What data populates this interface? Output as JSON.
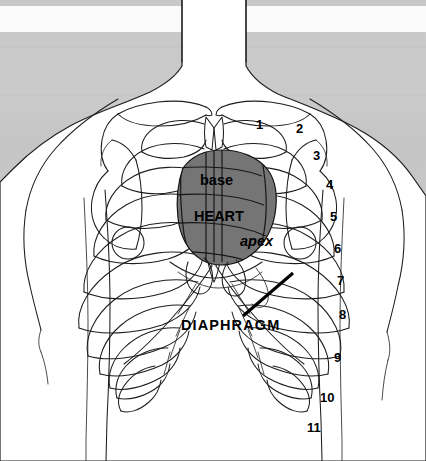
{
  "figure": {
    "width": 426,
    "height": 461,
    "colors": {
      "background_upper": "#c9c9c9",
      "background_lower": "#ffffff",
      "body_fill": "#ffffff",
      "outline": "#1d1d1d",
      "heart_fill": "#757575",
      "heart_outline": "#111111",
      "label_text": "#000000",
      "leader_line": "#000000"
    }
  },
  "organ_labels": [
    {
      "name": "base",
      "text": "base",
      "style": "bold",
      "x": 200,
      "y": 180
    },
    {
      "name": "heart",
      "text": "HEART",
      "style": "bold",
      "x": 194,
      "y": 216
    },
    {
      "name": "apex",
      "text": "apex",
      "style": "bold-italic",
      "x": 240,
      "y": 241
    }
  ],
  "structure_labels": [
    {
      "name": "diaphragm",
      "text": "DIAPHRAGM",
      "x": 181,
      "y": 325
    }
  ],
  "rib_numbers": [
    {
      "label": "1",
      "x": 256,
      "y": 124
    },
    {
      "label": "2",
      "x": 296,
      "y": 128
    },
    {
      "label": "3",
      "x": 313,
      "y": 155
    },
    {
      "label": "4",
      "x": 326,
      "y": 184
    },
    {
      "label": "5",
      "x": 330,
      "y": 216
    },
    {
      "label": "6",
      "x": 334,
      "y": 248
    },
    {
      "label": "7",
      "x": 337,
      "y": 280
    },
    {
      "label": "8",
      "x": 339,
      "y": 314
    },
    {
      "label": "9",
      "x": 334,
      "y": 357
    },
    {
      "label": "10",
      "x": 323,
      "y": 397
    },
    {
      "label": "11",
      "x": 310,
      "y": 427
    }
  ],
  "anatomy_notes": {
    "rib_count_labeled": 11,
    "heart_region": "shaded gray oval overlying ribs 2 through 6, left of sternum",
    "leader_line": "thick line from DIAPHRAGM label to the diaphragm dome beneath the heart apex"
  }
}
